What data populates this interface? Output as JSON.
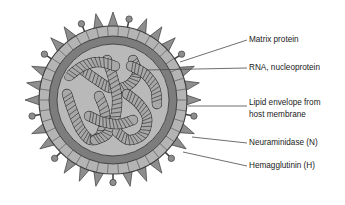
{
  "figure": {
    "background_color": "#ffffff"
  },
  "virus": {
    "center_x": 113,
    "center_y": 100,
    "spike_tip_radius": 88,
    "matrix_outer_radius": 74,
    "matrix_inner_radius": 64,
    "envelope_outer_radius": 64,
    "envelope_inner_radius": 56,
    "core_radius": 56,
    "spike_count": 32,
    "neuraminidase_count": 9,
    "colors": {
      "spike": "#8e8e8e",
      "matrix_ring": "#b4b4b4",
      "matrix_segment_line": "#5a5a5a",
      "lipid_envelope": "#7d7d7d",
      "core_fill": "#b9b9b9",
      "rna_fill": "#a8a8a8",
      "rna_stroke": "#2b2b2b",
      "outline": "#3c3c3c",
      "leader_line": "#4a4a4a",
      "text": "#1a1a1a"
    }
  },
  "labels": [
    {
      "id": "matrix-protein",
      "text": "Matrix protein",
      "text_x": 249,
      "text_y": 40,
      "leader_from_x": 247,
      "leader_from_y": 40,
      "leader_to_x": 180,
      "leader_to_y": 62
    },
    {
      "id": "rna-nucleoprotein",
      "text": "RNA, nucleoprotein",
      "text_x": 249,
      "text_y": 68,
      "leader_from_x": 247,
      "leader_from_y": 68,
      "leader_to_x": 146,
      "leader_to_y": 70
    },
    {
      "id": "lipid-envelope",
      "text": "Lipid envelope from",
      "text_line2": "host membrane",
      "text_x": 249,
      "text_y": 103,
      "text_y2": 115,
      "leader_from_x": 247,
      "leader_from_y": 106,
      "leader_to_x": 188,
      "leader_to_y": 106
    },
    {
      "id": "neuraminidase",
      "text": "Neuraminidase (N)",
      "text_x": 249,
      "text_y": 143,
      "leader_from_x": 247,
      "leader_from_y": 143,
      "leader_to_x": 192,
      "leader_to_y": 137
    },
    {
      "id": "hemagglutinin",
      "text": "Hemagglutinin (H)",
      "text_x": 249,
      "text_y": 166,
      "leader_from_x": 247,
      "leader_from_y": 166,
      "leader_to_x": 183,
      "leader_to_y": 152
    }
  ]
}
